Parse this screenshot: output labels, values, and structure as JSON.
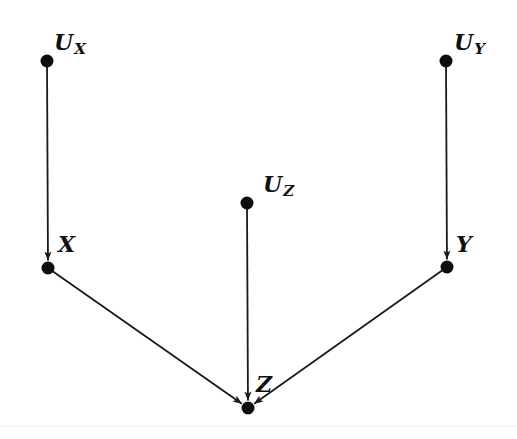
{
  "diagram": {
    "type": "causal-graph",
    "nodes": [
      {
        "id": "UX",
        "main": "U",
        "sub": "X",
        "x": 47,
        "y": 61,
        "label_x": 54,
        "label_y": 50
      },
      {
        "id": "UY",
        "main": "U",
        "sub": "Y",
        "x": 446,
        "y": 61,
        "label_x": 454,
        "label_y": 50
      },
      {
        "id": "UZ",
        "main": "U",
        "sub": "Z",
        "x": 247,
        "y": 203,
        "label_x": 263,
        "label_y": 192
      },
      {
        "id": "X",
        "main": "X",
        "sub": "",
        "x": 48,
        "y": 268,
        "label_x": 58,
        "label_y": 252
      },
      {
        "id": "Y",
        "main": "Y",
        "sub": "",
        "x": 447,
        "y": 267,
        "label_x": 456,
        "label_y": 252
      },
      {
        "id": "Z",
        "main": "Z",
        "sub": "",
        "x": 248,
        "y": 408,
        "label_x": 256,
        "label_y": 392
      }
    ],
    "edges": [
      {
        "from": "UX",
        "to": "X"
      },
      {
        "from": "UY",
        "to": "Y"
      },
      {
        "from": "UZ",
        "to": "Z"
      },
      {
        "from": "X",
        "to": "Z"
      },
      {
        "from": "Y",
        "to": "Z"
      }
    ],
    "colors": {
      "node": "#0d0d0d",
      "edge": "#1a1a1a",
      "background": "#ffffff"
    }
  }
}
